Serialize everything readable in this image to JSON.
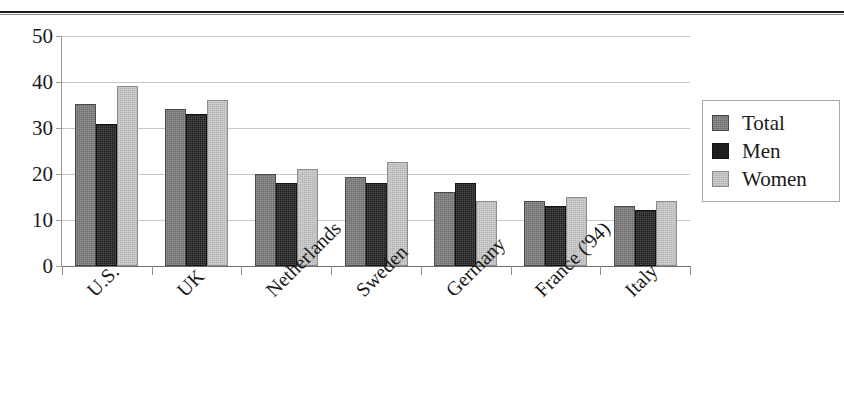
{
  "chart_data": {
    "type": "bar",
    "title": "",
    "subtitle": "",
    "xlabel": "",
    "ylabel": "",
    "ylim": [
      0,
      50
    ],
    "yticks": [
      0,
      10,
      20,
      30,
      40,
      50
    ],
    "grid": true,
    "legend_position": "right",
    "categories": [
      "U.S.",
      "UK",
      "Netherlands",
      "Sweden",
      "Germany",
      "France ('94)",
      "Italy"
    ],
    "series": [
      {
        "name": "Total",
        "color": "#6e6e6e",
        "values": [
          35.2,
          34.1,
          20.1,
          19.3,
          16.1,
          14.1,
          13.1
        ]
      },
      {
        "name": "Men",
        "color": "#1e1e1e",
        "values": [
          30.9,
          33.1,
          18.1,
          18.1,
          18.1,
          13.0,
          12.1
        ]
      },
      {
        "name": "Women",
        "color": "#d2d2d2",
        "values": [
          39.1,
          36.0,
          21.1,
          22.7,
          14.1,
          15.0,
          14.1
        ]
      }
    ]
  },
  "legend": {
    "items": [
      {
        "label": "Total",
        "swatch": "total-swatch"
      },
      {
        "label": "Men",
        "swatch": "men-swatch"
      },
      {
        "label": "Women",
        "swatch": "women-swatch"
      }
    ]
  },
  "axes": {
    "y": {
      "tick_labels": [
        "50",
        "40",
        "30",
        "20",
        "10",
        "0"
      ]
    },
    "x": {
      "tick_labels": [
        "U.S.",
        "UK",
        "Netherlands",
        "Sweden",
        "Germany",
        "France ('94)",
        "Italy"
      ]
    }
  },
  "decorations": {
    "top_rule": "horizontal-rule"
  }
}
